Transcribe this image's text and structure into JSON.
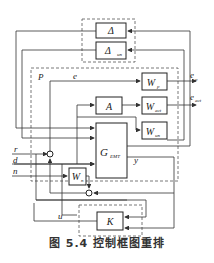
{
  "figure": {
    "caption": "图 5.4   控制框图重排",
    "blocks": {
      "delta": "Δ",
      "delta_un": "Δ",
      "delta_un_sub": "un",
      "wp": "W",
      "wp_sub": "p",
      "a": "A",
      "wact": "W",
      "wact_sub": "act",
      "wun": "W",
      "wun_sub": "un",
      "g": "G",
      "g_sub": "EMT",
      "wn": "W",
      "wn_sub": "n",
      "k": "K"
    },
    "labels": {
      "P": "P",
      "e": "e",
      "ep": "e",
      "ep_sub": "p",
      "eact": "e",
      "eact_sub": "act",
      "r": "r",
      "d": "d",
      "n": "n",
      "y": "y",
      "u": "u"
    },
    "colors": {
      "line": "#333333",
      "box": "#222222",
      "dashed": "#555555"
    }
  }
}
